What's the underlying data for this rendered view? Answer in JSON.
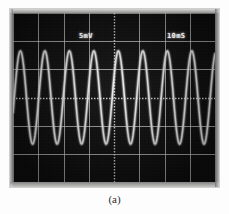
{
  "figure": {
    "caption": "(a)",
    "kind": "oscilloscope-photograph"
  },
  "scope": {
    "screen_labels": {
      "vertical_scale": "5mV",
      "timebase": "10mS"
    },
    "graticule": {
      "divisions_x": 8,
      "divisions_y": 6,
      "grid_color": "#d8d8d8",
      "center_line_style": "dotted",
      "screen_color": "#090909"
    },
    "trace": {
      "color": "#f2f2f2",
      "waveform": "sine",
      "cycles_visible": 8,
      "peak_to_peak_divisions": 3.3
    }
  },
  "chart_data": {
    "type": "line",
    "title": "",
    "xlabel": "",
    "ylabel": "",
    "x_units_per_division": "10mS",
    "y_units_per_division": "5mV",
    "xlim": [
      0,
      8
    ],
    "ylim": [
      -3,
      3
    ],
    "grid": true,
    "legend": "none",
    "series": [
      {
        "name": "sine-trace",
        "amplitude_divisions": 1.65,
        "period_divisions": 0.97,
        "phase_divisions": 0.05,
        "offset_divisions": 0.0
      }
    ]
  }
}
